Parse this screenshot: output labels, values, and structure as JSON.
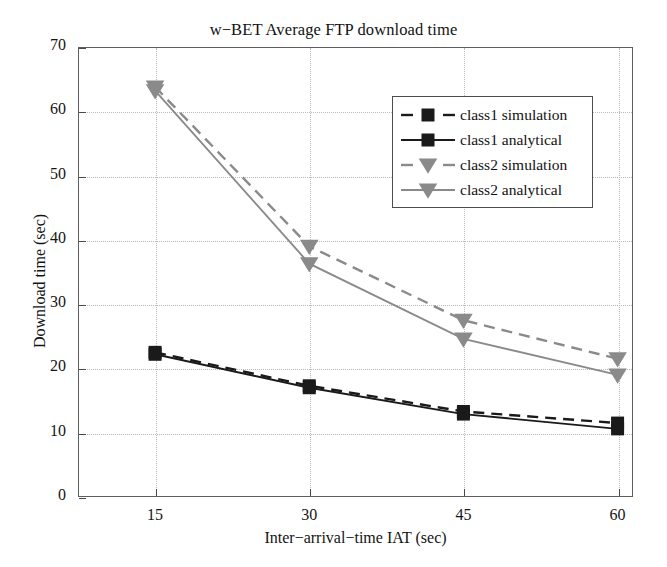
{
  "chart_data": {
    "type": "line",
    "title": "w−BET Average FTP download time",
    "xlabel": "Inter−arrival−time IAT (sec)",
    "ylabel": "Download time (sec)",
    "x": [
      15,
      30,
      45,
      60
    ],
    "xtick_labels": [
      "15",
      "30",
      "45",
      "60"
    ],
    "ytick_labels": [
      "0",
      "10",
      "20",
      "30",
      "40",
      "50",
      "60",
      "70"
    ],
    "yticks": [
      0,
      10,
      20,
      30,
      40,
      50,
      60,
      70
    ],
    "xlim": [
      7.5,
      61.5
    ],
    "ylim": [
      0,
      70
    ],
    "grid": true,
    "legend_position": "upper right",
    "series": [
      {
        "name": "class1 simulation",
        "values": [
          22.5,
          17.3,
          13.3,
          11.5
        ],
        "color": "#1a1a1a",
        "line_style": "dashed",
        "marker": "square"
      },
      {
        "name": "class1 analytical",
        "values": [
          22.2,
          17.0,
          12.9,
          10.6
        ],
        "color": "#1a1a1a",
        "line_style": "solid",
        "marker": "square"
      },
      {
        "name": "class2 simulation",
        "values": [
          63.8,
          39.0,
          27.5,
          21.5
        ],
        "color": "#8a8a8a",
        "line_style": "dashed",
        "marker": "triangle-down"
      },
      {
        "name": "class2 analytical",
        "values": [
          63.2,
          36.3,
          24.6,
          19.0
        ],
        "color": "#8a8a8a",
        "line_style": "solid",
        "marker": "triangle-down"
      }
    ]
  },
  "legend": {
    "items": [
      {
        "label": "class1 simulation"
      },
      {
        "label": "class1 analytical"
      },
      {
        "label": "class2 simulation"
      },
      {
        "label": "class2 analytical"
      }
    ]
  },
  "colors": {
    "class1": "#1a1a1a",
    "class2": "#8a8a8a",
    "axis": "#5d5d5d",
    "grid": "#b9b9b9",
    "background": "#ffffff"
  }
}
